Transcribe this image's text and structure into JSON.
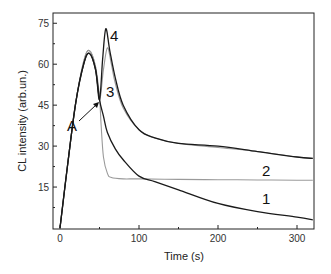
{
  "chart_data": {
    "type": "line",
    "title": "",
    "xlabel": "Time (s)",
    "ylabel": "CL intensity (arb.un.)",
    "xlim": [
      -10,
      320
    ],
    "ylim": [
      0,
      78
    ],
    "xticks": [
      0,
      100,
      200,
      300
    ],
    "xtick_labels": [
      "0",
      "100",
      "200",
      "300"
    ],
    "yticks": [
      15,
      30,
      45,
      60,
      75
    ],
    "ytick_labels": [
      "15",
      "30",
      "45",
      "60",
      "75"
    ],
    "grid": false,
    "legend": "none (curves labeled inline)",
    "annotations": [
      {
        "text": "A",
        "x": 30,
        "y": 37,
        "arrow_to": {
          "x": 50,
          "y": 47
        }
      },
      {
        "text": "1",
        "x": 262,
        "y": 9
      },
      {
        "text": "2",
        "x": 262,
        "y": 23
      },
      {
        "text": "3",
        "x": 60,
        "y": 50
      },
      {
        "text": "4",
        "x": 63,
        "y": 73
      }
    ],
    "series": [
      {
        "name": "1",
        "color": "#1a1a1a",
        "x": [
          0,
          10,
          20,
          30,
          37,
          45,
          50,
          55,
          60,
          70,
          80,
          100,
          120,
          150,
          200,
          250,
          300,
          320
        ],
        "y": [
          0,
          24,
          46,
          60,
          64,
          58,
          47,
          41,
          35,
          29,
          25,
          19,
          17,
          14,
          9,
          6,
          4,
          3
        ]
      },
      {
        "name": "2",
        "color": "#9a9a9a",
        "x": [
          0,
          10,
          20,
          30,
          37,
          45,
          50,
          52,
          55,
          60,
          65,
          80,
          100,
          150,
          200,
          250,
          300,
          320
        ],
        "y": [
          0,
          24,
          46,
          61,
          65,
          59,
          48,
          38,
          26,
          20,
          18.5,
          18,
          18,
          17.8,
          17.7,
          17.6,
          17.5,
          17.5
        ]
      },
      {
        "name": "3",
        "color": "#9a9a9a",
        "x": [
          0,
          10,
          20,
          30,
          37,
          45,
          50,
          55,
          60,
          65,
          70,
          80,
          100,
          120,
          150,
          200,
          250,
          300,
          320
        ],
        "y": [
          0,
          24,
          46,
          61,
          65,
          59,
          47,
          58,
          66,
          60,
          53,
          44,
          36,
          33,
          31,
          29.5,
          28,
          26,
          25.5
        ]
      },
      {
        "name": "4",
        "color": "#1a1a1a",
        "x": [
          0,
          10,
          20,
          30,
          37,
          45,
          50,
          54,
          58,
          63,
          70,
          80,
          100,
          120,
          150,
          200,
          250,
          300,
          320
        ],
        "y": [
          0,
          24,
          46,
          60,
          64,
          58,
          47,
          62,
          73,
          65,
          55,
          45,
          36,
          33,
          31,
          30,
          28,
          26,
          25.5
        ]
      }
    ]
  },
  "labels": {
    "xlabel": "Time (s)",
    "ylabel": "CL intensity (arb.un.)",
    "annotation_a": "A",
    "curve_1": "1",
    "curve_2": "2",
    "curve_3": "3",
    "curve_4": "4"
  }
}
